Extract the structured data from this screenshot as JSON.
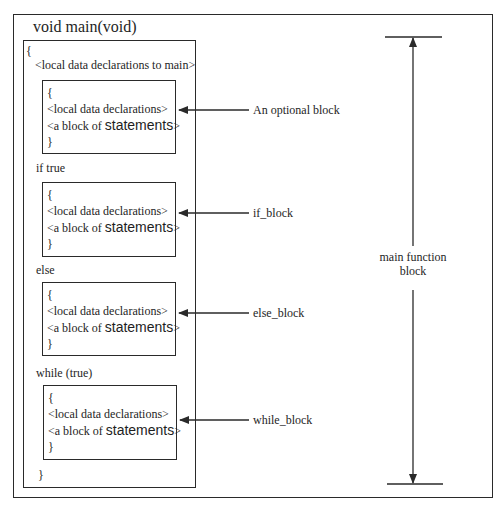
{
  "title": "void  main(void)",
  "main_block": {
    "open_brace": "{",
    "close_brace": "}",
    "main_declarations": "<local data declarations  to main>"
  },
  "sub_blocks": [
    {
      "id": "optional",
      "condition": "",
      "open_brace": "{",
      "declarations": "<local data declarations>",
      "statements_prefix": "<a block of ",
      "statements_word": "statements",
      "statements_suffix": ">",
      "close_brace": "}",
      "annotation": "An optional block"
    },
    {
      "id": "if",
      "condition": "if true",
      "open_brace": "{",
      "declarations": "<local data declarations>",
      "statements_prefix": "<a block of ",
      "statements_word": "statements",
      "statements_suffix": ">",
      "close_brace": "}",
      "annotation": "if_block"
    },
    {
      "id": "else",
      "condition": "else",
      "open_brace": "{",
      "declarations": "<local data declarations>",
      "statements_prefix": "<a block of ",
      "statements_word": "statements",
      "statements_suffix": ">",
      "close_brace": "}",
      "annotation": "else_block"
    },
    {
      "id": "while",
      "condition": "while (true)",
      "open_brace": "{",
      "declarations": "<local data declarations>",
      "statements_prefix": "<a block of ",
      "statements_word": "statements",
      "statements_suffix": ">",
      "close_brace": "}",
      "annotation": "while_block"
    }
  ],
  "span_label": {
    "line1": "main function",
    "line2": "block"
  },
  "colors": {
    "line": "#2a2a2a",
    "text": "#1e1e1e",
    "background": "#ffffff"
  }
}
